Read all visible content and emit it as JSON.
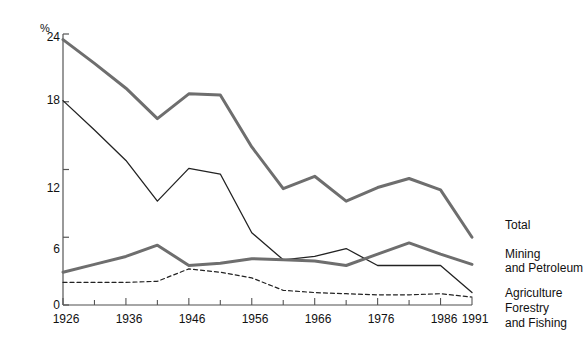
{
  "axis": {
    "y_unit": "%",
    "y_axis_title": "Percentage of Total Gross Domestic Product",
    "y_ticks": [
      "0",
      "6",
      "12",
      "18",
      "24"
    ],
    "x_ticks": [
      "1926",
      "1936",
      "1946",
      "1956",
      "1966",
      "1976",
      "1986",
      "1991"
    ]
  },
  "legend": {
    "total": "Total",
    "mining_line1": "Mining",
    "mining_line2": "and Petroleum",
    "agriculture_line1": "Agriculture",
    "agriculture_line2": "Forestry",
    "agriculture_line3": "and Fishing"
  },
  "colors": {
    "thick_gray": "#6e6e6e",
    "thin_black": "#222222",
    "axis": "#555555",
    "background": "#ffffff"
  },
  "chart_data": {
    "type": "line",
    "title": "",
    "xlabel": "",
    "ylabel": "Percentage of Total Gross Domestic Product",
    "xlim": [
      1926,
      1991
    ],
    "ylim": [
      0,
      24
    ],
    "y_unit": "%",
    "grid": false,
    "legend_position": "right",
    "x": [
      1926,
      1931,
      1936,
      1941,
      1946,
      1951,
      1956,
      1961,
      1966,
      1971,
      1976,
      1981,
      1986,
      1991
    ],
    "series": [
      {
        "name": "Total",
        "style": "thick-gray",
        "values": [
          23.5,
          21.4,
          19.2,
          16.5,
          18.7,
          18.6,
          14.0,
          10.3,
          11.4,
          9.2,
          10.4,
          11.2,
          10.2,
          6.0
        ]
      },
      {
        "name": "Agriculture Forestry and Fishing",
        "style": "thin-black",
        "values": [
          18.1,
          15.5,
          12.8,
          9.2,
          12.1,
          11.6,
          6.4,
          4.0,
          4.3,
          5.0,
          3.5,
          3.5,
          3.5,
          1.1
        ]
      },
      {
        "name": "Mining and Petroleum",
        "style": "thick-gray",
        "values": [
          2.9,
          3.6,
          4.3,
          5.3,
          3.5,
          3.7,
          4.1,
          4.0,
          3.9,
          3.5,
          4.5,
          5.5,
          4.5,
          3.6
        ]
      },
      {
        "name": "Agriculture (dashed)",
        "style": "dashed-black",
        "values": [
          2.0,
          2.0,
          2.0,
          2.1,
          3.2,
          2.9,
          2.4,
          1.3,
          1.1,
          1.0,
          0.9,
          0.9,
          1.0,
          0.7
        ]
      }
    ]
  }
}
